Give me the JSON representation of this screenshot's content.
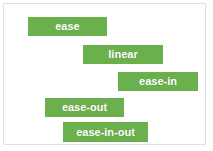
{
  "card": {
    "background_color": "#ffffff",
    "border_color": "#e0e0e0"
  },
  "bars": [
    {
      "label": "ease",
      "color": "#6ab04c",
      "text_color": "#ffffff"
    },
    {
      "label": "linear",
      "color": "#6ab04c",
      "text_color": "#ffffff"
    },
    {
      "label": "ease-in",
      "color": "#6ab04c",
      "text_color": "#ffffff"
    },
    {
      "label": "ease-out",
      "color": "#6ab04c",
      "text_color": "#ffffff"
    },
    {
      "label": "ease-in-out",
      "color": "#6ab04c",
      "text_color": "#ffffff"
    }
  ],
  "chart_data": {
    "type": "bar",
    "title": "",
    "xlabel": "",
    "ylabel": "",
    "orientation": "horizontal",
    "categories": [
      "ease",
      "linear",
      "ease-in",
      "ease-out",
      "ease-in-out"
    ],
    "bar_starts": [
      24,
      79,
      114,
      41,
      59
    ],
    "bar_ends": [
      103,
      159,
      194,
      120,
      144
    ],
    "bar_widths": [
      79,
      80,
      80,
      79,
      85
    ],
    "bar_tops": [
      13,
      41,
      68,
      94,
      118
    ],
    "bar_height": 19,
    "xlim": [
      0,
      213
    ],
    "grid": false,
    "legend": "none"
  }
}
